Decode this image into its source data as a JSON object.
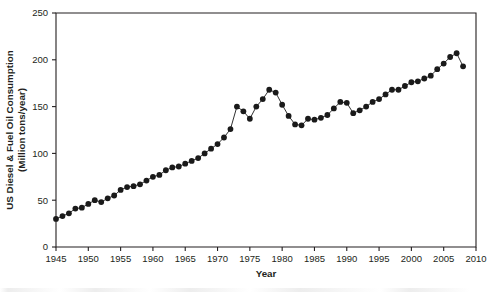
{
  "chart_data": {
    "type": "line",
    "title": "",
    "xlabel": "Year",
    "ylabel": "US Diesel & Fuel Oil Consumption (Million tons/year)",
    "ylabel_line1": "US Diesel & Fuel Oil Consumption",
    "ylabel_line2": "(Million tons/year)",
    "xlim": [
      1945,
      2010
    ],
    "ylim": [
      0,
      250
    ],
    "grid": false,
    "legend": "none",
    "marker": "filled-circle",
    "marker_color": "#1a1a1a",
    "line_color": "#1a1a1a",
    "xticks": [
      1945,
      1950,
      1955,
      1960,
      1965,
      1970,
      1975,
      1980,
      1985,
      1990,
      1995,
      2000,
      2005,
      2010
    ],
    "xticklabels": [
      "1945",
      "1950",
      "1955",
      "1960",
      "1965",
      "1970",
      "1975",
      "1980",
      "1985",
      "1990",
      "1995",
      "2000",
      "2005",
      "2010"
    ],
    "yticks": [
      0,
      50,
      100,
      150,
      200,
      250
    ],
    "yticklabels": [
      "0",
      "50",
      "100",
      "150",
      "200",
      "250"
    ],
    "series": [
      {
        "name": "US Diesel & Fuel Oil Consumption",
        "x": [
          1945,
          1946,
          1947,
          1948,
          1949,
          1950,
          1951,
          1952,
          1953,
          1954,
          1955,
          1956,
          1957,
          1958,
          1959,
          1960,
          1961,
          1962,
          1963,
          1964,
          1965,
          1966,
          1967,
          1968,
          1969,
          1970,
          1971,
          1972,
          1973,
          1974,
          1975,
          1976,
          1977,
          1978,
          1979,
          1980,
          1981,
          1982,
          1983,
          1984,
          1985,
          1986,
          1987,
          1988,
          1989,
          1990,
          1991,
          1992,
          1993,
          1994,
          1995,
          1996,
          1997,
          1998,
          1999,
          2000,
          2001,
          2002,
          2003,
          2004,
          2005,
          2006,
          2007,
          2008
        ],
        "values": [
          30,
          33,
          36,
          41,
          42,
          46,
          50,
          48,
          52,
          55,
          61,
          64,
          65,
          67,
          71,
          75,
          77,
          82,
          85,
          86,
          89,
          92,
          95,
          100,
          105,
          110,
          117,
          126,
          150,
          145,
          137,
          150,
          158,
          168,
          165,
          152,
          140,
          131,
          130,
          137,
          136,
          138,
          141,
          148,
          155,
          154,
          143,
          146,
          150,
          155,
          158,
          163,
          168,
          168,
          172,
          176,
          177,
          180,
          183,
          190,
          196,
          203,
          207,
          193
        ]
      }
    ]
  },
  "axes": {
    "x_title": "Year",
    "y_title_line1": "US Diesel & Fuel Oil Consumption",
    "y_title_line2": "(Million tons/year)"
  }
}
